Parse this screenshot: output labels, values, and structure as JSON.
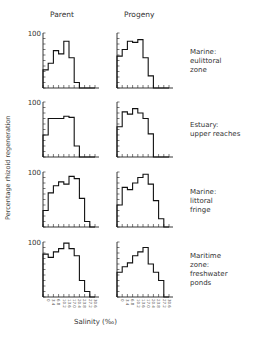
{
  "columns": [
    "Parent",
    "Progeny"
  ],
  "rows": [
    {
      "label": "Marine:\neulittoral\nzone"
    },
    {
      "label": "Estuary:\nupper reaches"
    },
    {
      "label": "Marine:\nlittoral\nfringe"
    },
    {
      "label": "Maritime\nzone:\nfreshwater\nponds"
    }
  ],
  "ylabel": "Percentage rhizoid regeneration",
  "xlabel": "Salinity (‰)",
  "ytick_top": "100",
  "chart_data": {
    "type": "bar",
    "title": "",
    "xlabel": "Salinity (‰)",
    "ylabel": "Percentage rhizoid regeneration",
    "ylim": [
      0,
      100
    ],
    "categories": [
      "0",
      "3.4",
      "6.8",
      "10.2",
      "13.6",
      "17.0",
      "20.4",
      "23.8",
      "27.2",
      "30.6"
    ],
    "panels": [
      {
        "row": "Marine: eulittoral zone",
        "column": "Parent",
        "values": [
          33,
          45,
          68,
          62,
          85,
          55,
          10,
          0,
          0,
          0
        ]
      },
      {
        "row": "Marine: eulittoral zone",
        "column": "Progeny",
        "values": [
          58,
          70,
          85,
          83,
          88,
          55,
          22,
          0,
          0,
          0
        ]
      },
      {
        "row": "Estuary: upper reaches",
        "column": "Parent",
        "values": [
          40,
          70,
          70,
          70,
          74,
          72,
          20,
          0,
          0,
          0
        ]
      },
      {
        "row": "Estuary: upper reaches",
        "column": "Progeny",
        "values": [
          55,
          82,
          78,
          88,
          80,
          70,
          42,
          0,
          0,
          0
        ]
      },
      {
        "row": "Marine: littoral fringe",
        "column": "Parent",
        "values": [
          30,
          62,
          75,
          82,
          78,
          92,
          88,
          52,
          10,
          0
        ]
      },
      {
        "row": "Marine: littoral fringe",
        "column": "Progeny",
        "values": [
          40,
          72,
          68,
          80,
          90,
          96,
          78,
          48,
          15,
          0
        ]
      },
      {
        "row": "Maritime zone: freshwater ponds",
        "column": "Parent",
        "values": [
          78,
          72,
          82,
          88,
          98,
          88,
          75,
          30,
          10,
          0
        ]
      },
      {
        "row": "Maritime zone: freshwater ponds",
        "column": "Progeny",
        "values": [
          45,
          55,
          62,
          75,
          82,
          90,
          60,
          45,
          30,
          0
        ]
      }
    ]
  }
}
